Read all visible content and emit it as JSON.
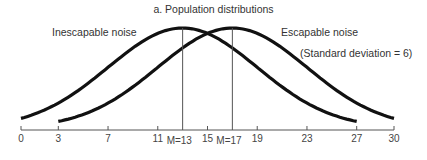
{
  "chart_data": {
    "type": "line",
    "title": "a. Population distributions",
    "xlabel": "",
    "ylabel": "",
    "xlim": [
      0,
      30
    ],
    "grid": false,
    "x_ticks": [
      0,
      3,
      7,
      11,
      15,
      19,
      23,
      27,
      30
    ],
    "series": [
      {
        "name": "Inescapable noise",
        "distribution": "normal",
        "mean": 13,
        "sd": 6,
        "x_range": [
          0,
          27
        ]
      },
      {
        "name": "Escapable noise",
        "distribution": "normal",
        "mean": 17,
        "sd": 6,
        "x_range": [
          3,
          30
        ]
      }
    ],
    "annotations": [
      "(Standard deviation = 6)",
      "M=13",
      "M=17"
    ]
  },
  "labels": {
    "title": "a. Population distributions",
    "inescapable": "Inescapable noise",
    "escapable": "Escapable noise",
    "sd_note": "(Standard deviation = 6)",
    "m1": "M=13",
    "m2": "M=17"
  },
  "ticks": [
    "0",
    "3",
    "7",
    "11",
    "15",
    "19",
    "23",
    "27",
    "30"
  ]
}
